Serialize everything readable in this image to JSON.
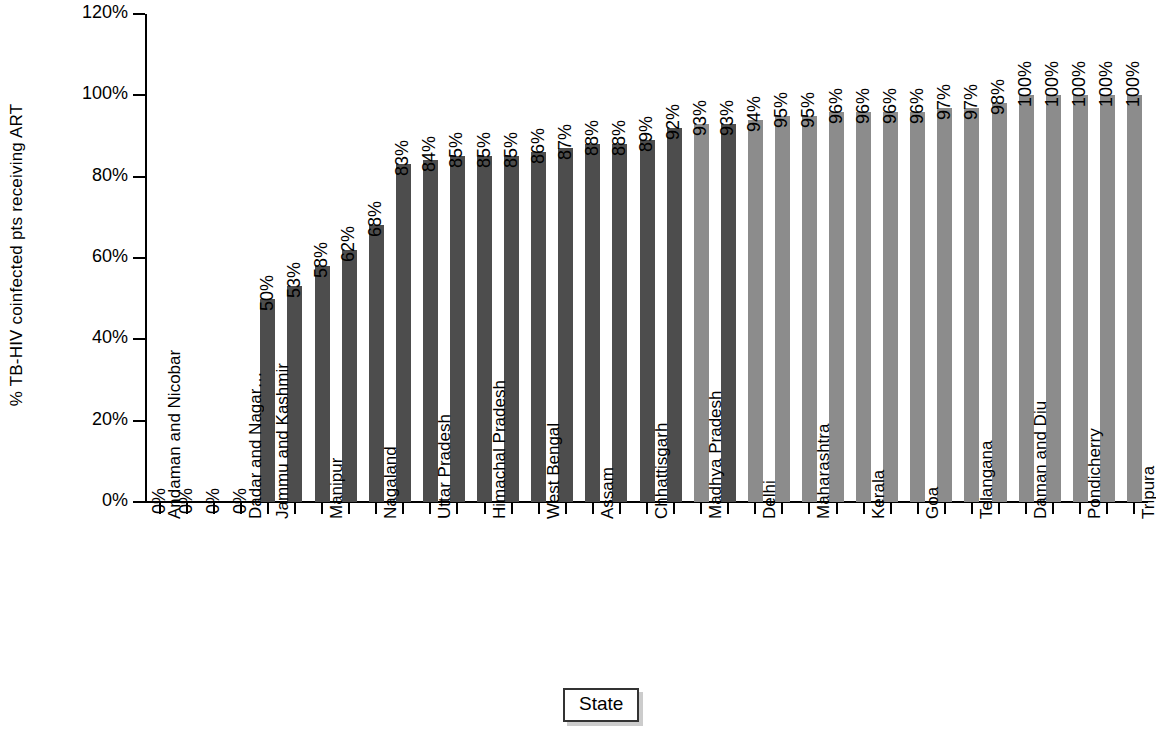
{
  "chart_data": {
    "type": "bar",
    "title": "",
    "xlabel": "State",
    "ylabel": "% TB-HIV coinfected pts receiving ART",
    "ylim": [
      0,
      120
    ],
    "ytick_labels": [
      "0%",
      "20%",
      "40%",
      "60%",
      "80%",
      "100%",
      "120%"
    ],
    "ytick_values": [
      0,
      20,
      40,
      60,
      80,
      100,
      120
    ],
    "grid": false,
    "legend": "none",
    "series_colors": {
      "dark": "#4d4d4d",
      "light": "#8c8c8c"
    },
    "categories": [
      "Andaman and Nicobar",
      "Lakshadweep",
      "Mizoram",
      "Dadar and Nagar Haveli",
      "Jammu and Kashmir",
      "Bihar",
      "Manipur",
      "Meghalaya",
      "Nagaland",
      "Jharkhand",
      "Uttar Pradesh",
      "Haryana",
      "Himachal Pradesh",
      "Punjab",
      "West Bengal",
      "Odisha",
      "Assam",
      "Rajasthan",
      "Chhattisgarh",
      "Gujarat",
      "Madhya Pradesh",
      "Uttarakhand",
      "Delhi",
      "Sikkim",
      "Maharashtra",
      "Karnataka",
      "Kerala",
      "Andhra Pradesh",
      "Goa",
      "Chandigarh",
      "Telangana",
      "Arunachal Pradesh",
      "Daman and Diu",
      "Tamil Nadu",
      "Pondicherry",
      "Nagarjuna",
      "Tripura"
    ],
    "visible_category_labels": [
      "Andaman and Nicobar",
      "Dadar and Nagar Haveli",
      "Jammu and Kashmir",
      "Manipur",
      "Nagaland",
      "Uttar Pradesh",
      "Himachal Pradesh",
      "West Bengal",
      "Assam",
      "Chhattisgarh",
      "Madhya Pradesh",
      "Delhi",
      "Maharashtra",
      "Kerala",
      "Goa",
      "Telangana",
      "Daman and Diu",
      "Pondicherry",
      "Tripura"
    ],
    "values": [
      0,
      0,
      0,
      0,
      50,
      53,
      58,
      62,
      68,
      83,
      84,
      85,
      85,
      85,
      86,
      87,
      88,
      88,
      89,
      92,
      93,
      93,
      94,
      95,
      95,
      96,
      96,
      96,
      96,
      97,
      97,
      98,
      100,
      100,
      100,
      100,
      100
    ],
    "value_labels": [
      "0%",
      "0%",
      "0%",
      "0%",
      "50%",
      "53%",
      "58%",
      "62%",
      "68%",
      "83%",
      "84%",
      "85%",
      "85%",
      "85%",
      "86%",
      "87%",
      "88%",
      "88%",
      "89%",
      "92%",
      "93%",
      "93%",
      "94%",
      "95%",
      "95%",
      "96%",
      "96%",
      "96%",
      "96%",
      "97%",
      "97%",
      "98%",
      "100%",
      "100%",
      "100%",
      "100%",
      "100%"
    ],
    "bar_shades": [
      "dark",
      "dark",
      "dark",
      "dark",
      "dark",
      "dark",
      "dark",
      "dark",
      "dark",
      "dark",
      "dark",
      "dark",
      "dark",
      "dark",
      "dark",
      "dark",
      "dark",
      "dark",
      "dark",
      "dark",
      "light",
      "dark",
      "light",
      "light",
      "light",
      "light",
      "light",
      "light",
      "light",
      "light",
      "light",
      "light",
      "light",
      "light",
      "light",
      "light",
      "light"
    ]
  }
}
